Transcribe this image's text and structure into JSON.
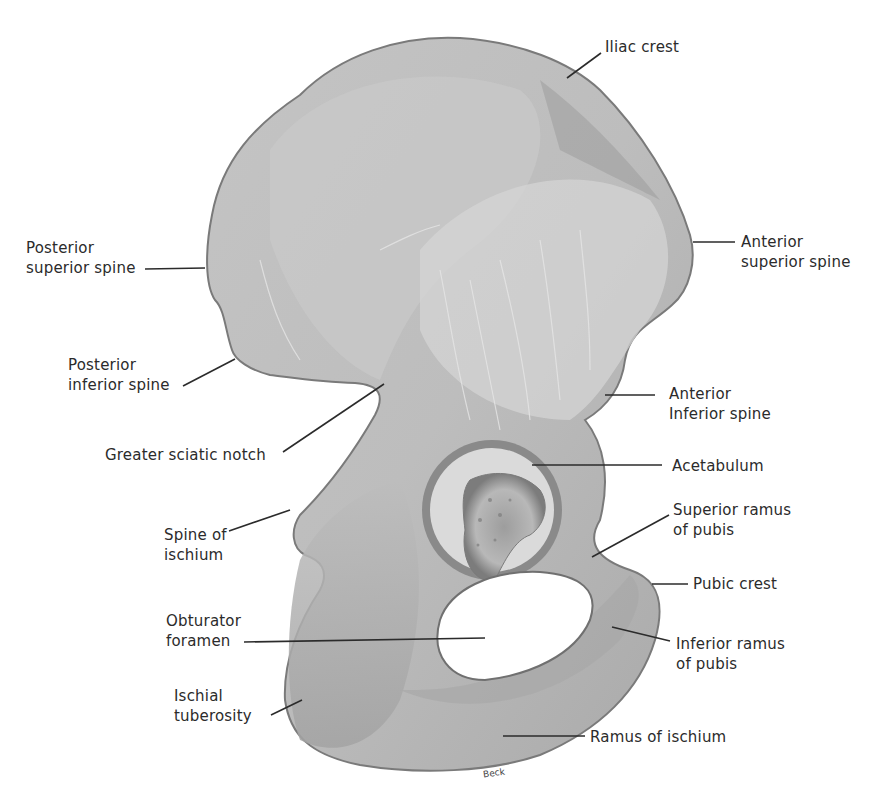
{
  "figure": {
    "colors": {
      "bone_fill": "#b9b9b9",
      "bone_light": "#d8d8d8",
      "bone_dark": "#8a8a8a",
      "outline": "#6e6e6e",
      "leader_line": "#2b2b2b",
      "background": "#ffffff"
    },
    "credit": "Beck"
  },
  "labels": [
    {
      "id": "iliac-crest",
      "lines": [
        "Iliac crest"
      ]
    },
    {
      "id": "posterior-superior-spine",
      "lines": [
        "Posterior",
        "superior spine"
      ]
    },
    {
      "id": "anterior-superior-spine",
      "lines": [
        "Anterior",
        "superior spine"
      ]
    },
    {
      "id": "posterior-inferior-spine",
      "lines": [
        "Posterior",
        "inferior spine"
      ]
    },
    {
      "id": "anterior-inferior-spine",
      "lines": [
        "Anterior",
        "Inferior spine"
      ]
    },
    {
      "id": "greater-sciatic-notch",
      "lines": [
        "Greater sciatic notch"
      ]
    },
    {
      "id": "acetabulum",
      "lines": [
        "Acetabulum"
      ]
    },
    {
      "id": "superior-ramus-of-pubis",
      "lines": [
        "Superior ramus",
        "of pubis"
      ]
    },
    {
      "id": "spine-of-ischium",
      "lines": [
        "Spine of",
        "ischium"
      ]
    },
    {
      "id": "pubic-crest",
      "lines": [
        "Pubic crest"
      ]
    },
    {
      "id": "obturator-foramen",
      "lines": [
        "Obturator",
        "foramen"
      ]
    },
    {
      "id": "inferior-ramus-of-pubis",
      "lines": [
        "Inferior ramus",
        "of pubis"
      ]
    },
    {
      "id": "ischial-tuberosity",
      "lines": [
        "Ischial",
        "tuberosity"
      ]
    },
    {
      "id": "ramus-of-ischium",
      "lines": [
        "Ramus of ischium"
      ]
    }
  ]
}
